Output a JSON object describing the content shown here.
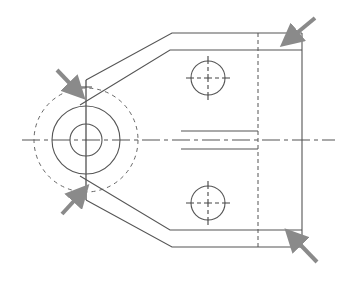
{
  "diagram": {
    "type": "technical-drawing",
    "colors": {
      "line": "#555555",
      "arrow": "#8a8a8a",
      "background": "#ffffff"
    },
    "arrows": [
      {
        "name": "arrow-upper-left",
        "from": [
          57,
          70
        ],
        "to": [
          82,
          96
        ]
      },
      {
        "name": "arrow-lower-left",
        "from": [
          62,
          214
        ],
        "to": [
          86,
          188
        ]
      },
      {
        "name": "arrow-upper-right",
        "from": [
          315,
          18
        ],
        "to": [
          283,
          44
        ]
      },
      {
        "name": "arrow-lower-right",
        "from": [
          317,
          262
        ],
        "to": [
          288,
          232
        ]
      }
    ]
  }
}
